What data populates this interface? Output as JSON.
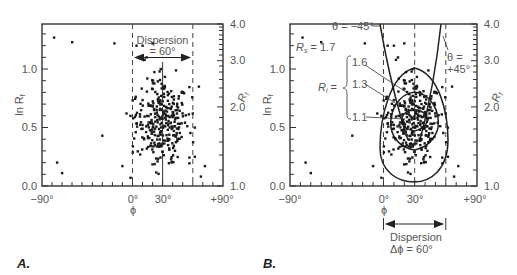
{
  "chart_data": [
    {
      "type": "scatter",
      "panel": "A.",
      "title": "",
      "xlabel": "ϕ",
      "ylabel": "ln R_f",
      "ylabel_right": "R_f",
      "xlim": [
        -90,
        90
      ],
      "ylim": [
        0.0,
        1.386
      ],
      "x_ticks": [
        "-90°",
        "0°",
        "30°",
        "+90°"
      ],
      "y_ticks_left": [
        "0.0",
        "0.5",
        "1.0"
      ],
      "y_ticks_right": [
        "1.0",
        "2.0",
        "3.0",
        "4.0"
      ],
      "annotations": [
        "Dispersion",
        "= 60°"
      ],
      "reference_lines": {
        "dashed_x": [
          0,
          60
        ],
        "center_tick_x": 30
      },
      "grid": false,
      "points_description": "~300 points concentrated between ϕ = 0° and 60°, centered near ϕ = 30°, ln Rf ≈ 0.55; scattered outliers at ϕ ≈ -78°, -65°, -52°, -30°, -10° and high values near ln Rf ≈ 1.2-1.3"
    },
    {
      "type": "scatter",
      "panel": "B.",
      "title": "",
      "xlabel": "ϕ",
      "ylabel": "ln R_f",
      "ylabel_right": "R_f",
      "xlim": [
        -90,
        90
      ],
      "ylim": [
        0.0,
        1.386
      ],
      "x_ticks": [
        "-90°",
        "0°",
        "30°",
        "+90°"
      ],
      "y_ticks_left": [
        "0.0",
        "0.5",
        "1.0"
      ],
      "y_ticks_right": [
        "1.0",
        "2.0",
        "3.0",
        "4.0"
      ],
      "annotations": [
        "Rs = 1.7",
        "θ = -45°",
        "θ = +45°",
        "Ri = {1.6, 1.3, 1.1}",
        "Dispersion",
        "Δϕ = 60°"
      ],
      "overlay_curves": {
        "theta_curves": [
          -45,
          45
        ],
        "Ri_curves": [
          1.6,
          1.3,
          1.1
        ],
        "Rs": 1.7
      },
      "reference_lines": {
        "dashed_x": [
          0,
          60
        ],
        "center_tick_x": 30
      },
      "grid": false
    }
  ],
  "panelA": {
    "label": "A.",
    "y_left_title": "ln R",
    "y_left_sub": "f",
    "y_right_title": "R",
    "y_right_sub": "f",
    "y_left_ticks": [
      "1.0",
      "0.5",
      "0.0"
    ],
    "y_right_ticks": [
      "4.0",
      "3.0",
      "2.0",
      "1.0"
    ],
    "x_ticks": [
      "−90°",
      "0°",
      "30°",
      "+90°"
    ],
    "x_title": "ϕ",
    "dispersion_line1": "Dispersion",
    "dispersion_line2": "= 60°"
  },
  "panelB": {
    "label": "B.",
    "y_left_title": "ln R",
    "y_left_sub": "f",
    "y_right_title": "R",
    "y_right_sub": "f",
    "y_left_ticks": [
      "1.0",
      "0.5",
      "0.0"
    ],
    "y_right_ticks": [
      "4.0",
      "3.0",
      "2.0",
      "1.0"
    ],
    "x_ticks": [
      "−90°",
      "0°",
      "30°",
      "+90°"
    ],
    "x_title": "ϕ",
    "rs_label": "R",
    "rs_sub": "s",
    "rs_value": " = 1.7",
    "theta_neg": "θ = −45°",
    "theta_pos_1": "θ =",
    "theta_pos_2": "+45°",
    "ri_label": "R",
    "ri_sub": "i",
    "ri_eq": " =",
    "ri_values": [
      "1.6",
      "1.3",
      "1.1"
    ],
    "dispersion_line1": "Dispersion",
    "dispersion_line2": "Δϕ = 60°"
  }
}
